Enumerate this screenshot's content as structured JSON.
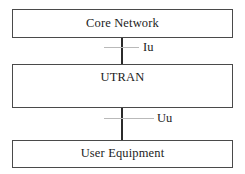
{
  "diagram": {
    "type": "block-diagram",
    "background_color": "#ffffff",
    "box_border_color": "#4a4a4a",
    "connector_color": "#2b2b2b",
    "tick_color": "#b9b9b9",
    "text_color": "#1c1c1c",
    "nodes": [
      {
        "id": "core-network",
        "label": "Core Network"
      },
      {
        "id": "utran",
        "label": "UTRAN"
      },
      {
        "id": "user-equipment",
        "label": "User Equipment"
      }
    ],
    "interfaces": [
      {
        "id": "iu",
        "label": "Iu",
        "from": "core-network",
        "to": "utran"
      },
      {
        "id": "uu",
        "label": "Uu",
        "from": "utran",
        "to": "user-equipment"
      }
    ]
  }
}
